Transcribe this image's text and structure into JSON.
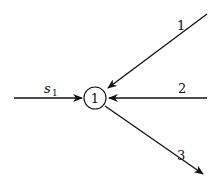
{
  "diagram": {
    "node": {
      "label": "1",
      "cx": 95,
      "cy": 98,
      "r": 11
    },
    "edges": [
      {
        "id": "s1",
        "label_main": "s",
        "label_sub": "1",
        "direction": "in"
      },
      {
        "id": "1",
        "label": "1",
        "direction": "in"
      },
      {
        "id": "2",
        "label": "2",
        "direction": "in"
      },
      {
        "id": "3",
        "label": "3",
        "direction": "out"
      }
    ],
    "stroke_color": "#111111"
  }
}
